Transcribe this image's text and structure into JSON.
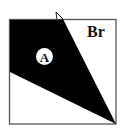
{
  "diagram": {
    "type": "folded-square",
    "colors": {
      "fill": "#000000",
      "background": "#ffffff",
      "outline": "#555555"
    },
    "square": {
      "x": 9,
      "y": 19,
      "width": 107,
      "height": 105
    },
    "regions": [
      {
        "id": "A",
        "label": "A",
        "fill": "#000000",
        "label_style": "circled"
      },
      {
        "id": "Br",
        "label": "Br",
        "fill": "#ffffff",
        "label_style": "plain"
      }
    ]
  }
}
